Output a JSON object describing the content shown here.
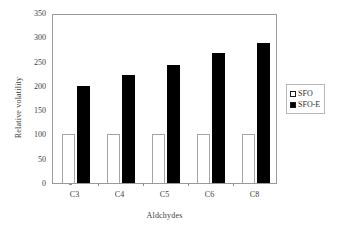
{
  "chart_data": {
    "type": "bar",
    "title": "",
    "xlabel": "Aldchydes",
    "ylabel": "Relative volatility",
    "categories": [
      "C3",
      "C4",
      "C5",
      "C6",
      "C8"
    ],
    "series": [
      {
        "name": "SFO",
        "values": [
          100,
          100,
          100,
          100,
          100
        ],
        "color": "#ffffff"
      },
      {
        "name": "SFO-E",
        "values": [
          200,
          223,
          242,
          267,
          288
        ],
        "color": "#000000"
      }
    ],
    "ylim": [
      0,
      350
    ],
    "ytick_labels": [
      "0",
      "50",
      "100",
      "150",
      "200",
      "250",
      "300",
      "350"
    ],
    "ytick_values": [
      0,
      50,
      100,
      150,
      200,
      250,
      300,
      350
    ],
    "grid": false,
    "legend_position": "right",
    "legend_entries": [
      {
        "label": "SFO",
        "swatch": "open-square"
      },
      {
        "label": "SFO-E",
        "swatch": "filled-square"
      }
    ]
  }
}
